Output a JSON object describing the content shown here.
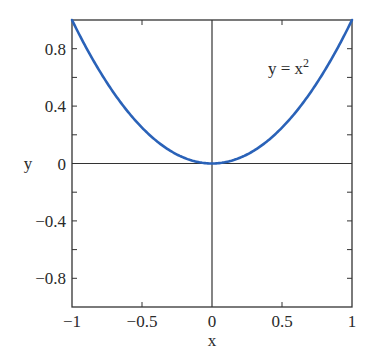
{
  "chart_data": {
    "type": "line",
    "title": "",
    "xlabel": "x",
    "ylabel": "y",
    "xlim": [
      -1,
      1
    ],
    "ylim": [
      -1,
      1
    ],
    "x_ticks": [
      -1,
      -0.5,
      0,
      0.5,
      1
    ],
    "x_tick_labels": [
      "−1",
      "−0.5",
      "0",
      "0.5",
      "1"
    ],
    "y_ticks": [
      -0.8,
      -0.4,
      0,
      0.4,
      0.8
    ],
    "y_tick_labels": [
      "−0.8",
      "−0.4",
      "0",
      "0.4",
      "0.8"
    ],
    "y_minor_ticks": [
      -0.8,
      -0.6,
      -0.4,
      -0.2,
      0.2,
      0.4,
      0.6,
      0.8
    ],
    "grid": false,
    "zero_lines": true,
    "series": [
      {
        "name": "y = x^2",
        "color": "#2a62b8",
        "x": [
          -1,
          -0.9,
          -0.8,
          -0.7,
          -0.6,
          -0.5,
          -0.4,
          -0.3,
          -0.2,
          -0.1,
          0,
          0.1,
          0.2,
          0.3,
          0.4,
          0.5,
          0.6,
          0.7,
          0.8,
          0.9,
          1
        ],
        "y": [
          1,
          0.81,
          0.64,
          0.49,
          0.36,
          0.25,
          0.16,
          0.09,
          0.04,
          0.01,
          0,
          0.01,
          0.04,
          0.09,
          0.16,
          0.25,
          0.36,
          0.49,
          0.64,
          0.81,
          1
        ]
      }
    ],
    "annotations": [
      {
        "text_base": "y = x",
        "superscript": "2",
        "x": 0.55,
        "y": 0.87
      }
    ]
  },
  "labels": {
    "xlabel": "x",
    "ylabel": "y",
    "annotation_base": "y = x",
    "annotation_sup": "2"
  }
}
